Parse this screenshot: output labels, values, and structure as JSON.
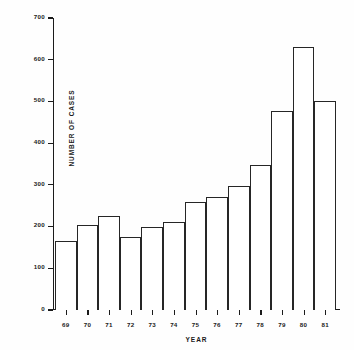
{
  "chart_data": {
    "type": "bar",
    "title": "",
    "xlabel": "YEAR",
    "ylabel": "NUMBER OF CASES",
    "categories": [
      "69",
      "70",
      "71",
      "72",
      "73",
      "74",
      "75",
      "76",
      "77",
      "78",
      "79",
      "80",
      "81"
    ],
    "values": [
      165,
      203,
      225,
      175,
      198,
      210,
      258,
      270,
      297,
      348,
      478,
      630,
      500
    ],
    "ylim": [
      0,
      700
    ],
    "ytick_labels": [
      "0",
      "100",
      "200",
      "300",
      "400",
      "500",
      "600",
      "700"
    ],
    "ytick_values": [
      0,
      100,
      200,
      300,
      400,
      500,
      600,
      700
    ],
    "grid": false,
    "legend": null,
    "bar_fill": "#ffffff",
    "bar_edge": "#262626",
    "axis_color": "#1b1b1b",
    "background": "#ffffff"
  }
}
